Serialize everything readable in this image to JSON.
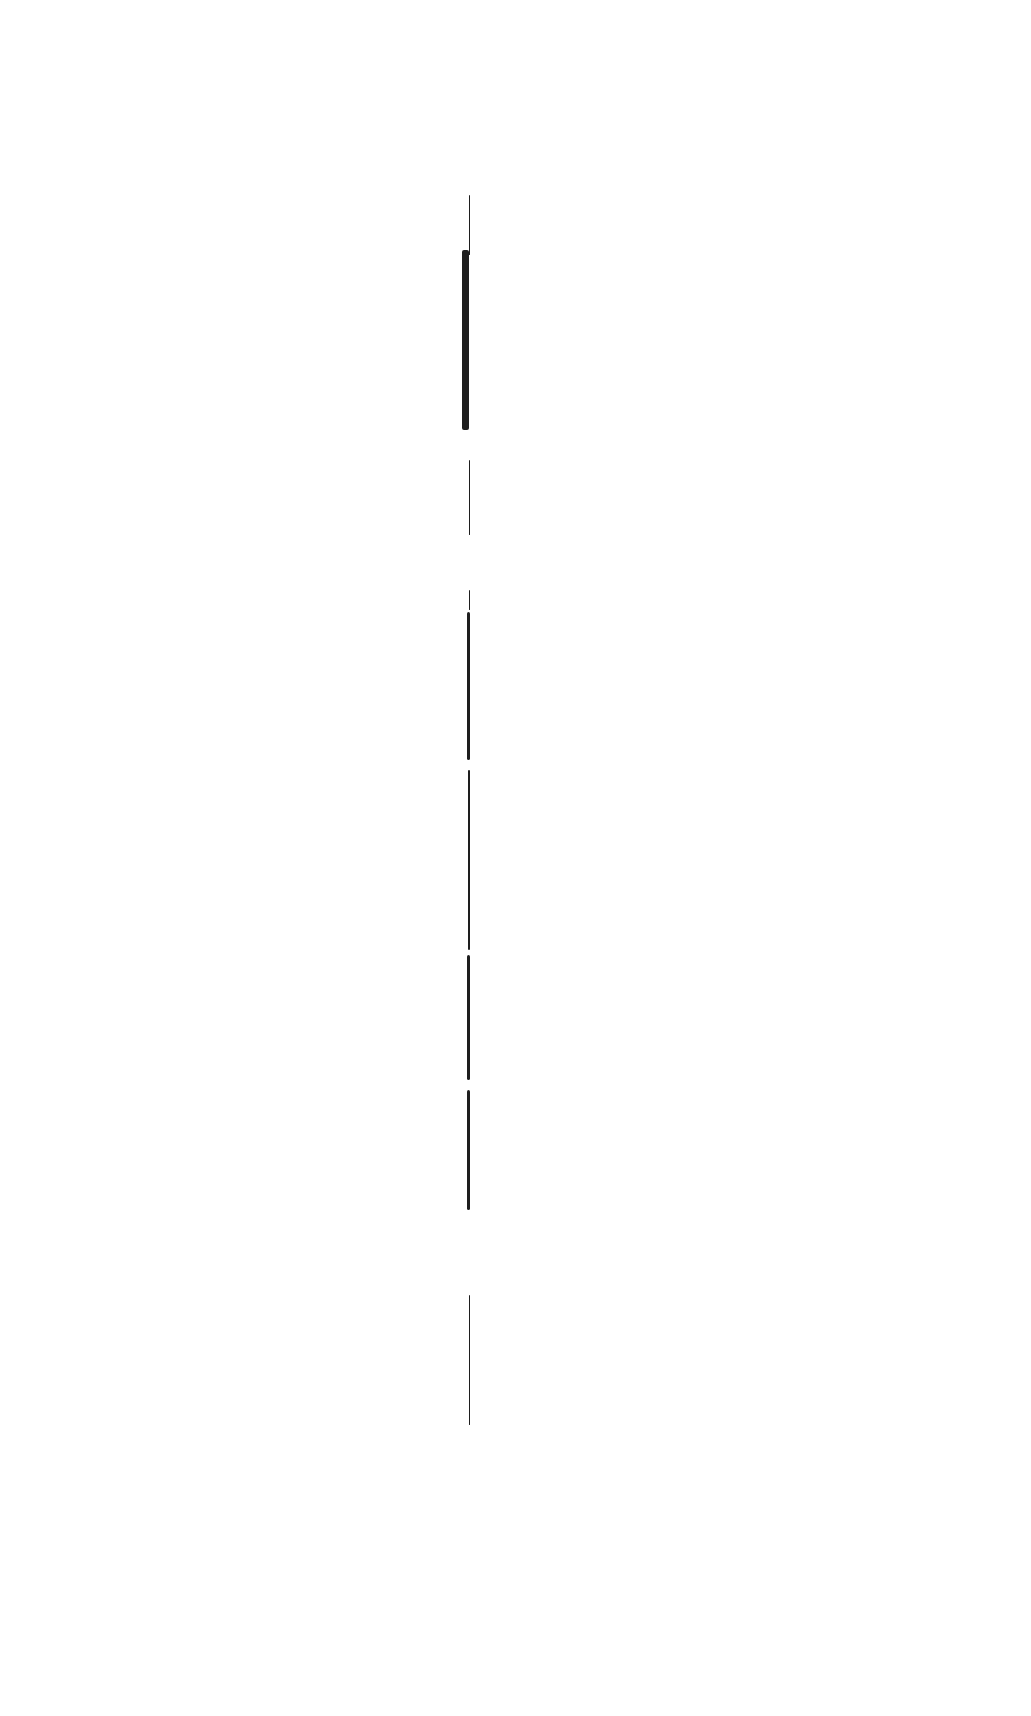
{
  "page": {
    "background": "#ffffff",
    "line_color": "#1e1e1e",
    "gutter_segments": [
      {
        "x": 469,
        "y": 195,
        "w": 1,
        "h": 60
      },
      {
        "x": 462,
        "y": 250,
        "w": 7,
        "h": 180
      },
      {
        "x": 469,
        "y": 460,
        "w": 1,
        "h": 75
      },
      {
        "x": 469,
        "y": 590,
        "w": 1,
        "h": 20
      },
      {
        "x": 467,
        "y": 612,
        "w": 3,
        "h": 148
      },
      {
        "x": 468,
        "y": 770,
        "w": 2,
        "h": 180
      },
      {
        "x": 467,
        "y": 955,
        "w": 3,
        "h": 125
      },
      {
        "x": 467,
        "y": 1090,
        "w": 3,
        "h": 120
      },
      {
        "x": 469,
        "y": 1295,
        "w": 1,
        "h": 130
      }
    ]
  }
}
